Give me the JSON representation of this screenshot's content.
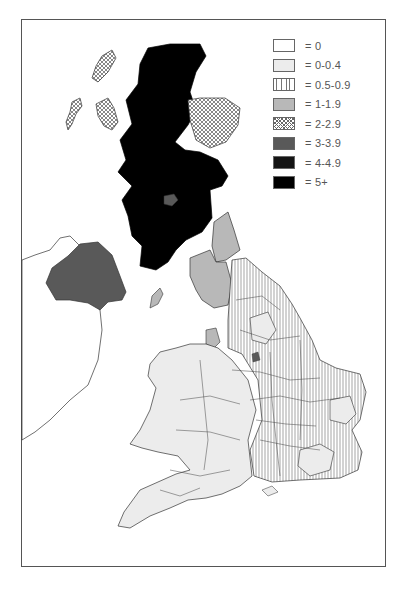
{
  "figure": {
    "type": "choropleth-map",
    "region": "United Kingdom and Ireland (county level)",
    "caption_partial": "(caption text cut off at bottom edge)"
  },
  "legend": {
    "items": [
      {
        "label": "= 0",
        "fill": "white",
        "color": "#ffffff"
      },
      {
        "label": "= 0-0.4",
        "fill": "light-grey",
        "color": "#ececec"
      },
      {
        "label": "= 0.5-0.9",
        "fill": "vertical-hatch",
        "color": "#ffffff"
      },
      {
        "label": "= 1-1.9",
        "fill": "mid-grey",
        "color": "#b8b8b8"
      },
      {
        "label": "= 2-2.9",
        "fill": "crosshatch",
        "color": "#ffffff"
      },
      {
        "label": "= 3-3.9",
        "fill": "dark-grey",
        "color": "#595959"
      },
      {
        "label": "= 4-4.9",
        "fill": "near-black",
        "color": "#141414"
      },
      {
        "label": "= 5+",
        "fill": "black",
        "color": "#000000"
      }
    ]
  },
  "regions": {
    "scotland_main": "= 5+",
    "scotland_northeast_grampian": "= 2-2.9",
    "shetland_orkney_western_isles": "= 2-2.9",
    "scotland_central_small": "= 3-3.9",
    "northern_ireland": "= 3-3.9",
    "republic_of_ireland": "= 0",
    "northumberland_cumbria": "= 1-1.9",
    "isle_of_man": "= 1-1.9",
    "lancashire_area": "= 1-1.9",
    "east_england_counties": "= 0.5-0.9",
    "wales_southwest_midlands": "= 0-0.4"
  }
}
